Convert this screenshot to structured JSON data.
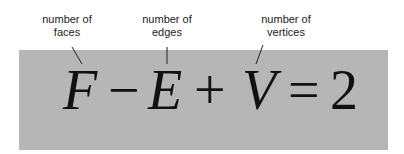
{
  "labels": {
    "faces": [
      "number of",
      "faces"
    ],
    "edges": [
      "number of",
      "edges"
    ],
    "vertices": [
      "number of",
      "vertices"
    ]
  },
  "formula": {
    "f": "F",
    "minus": "−",
    "e": "E",
    "plus": "+",
    "v": "V",
    "equals": "=",
    "rhs": "2"
  },
  "colors": {
    "box": "#b6b6b6",
    "text": "#111111"
  }
}
